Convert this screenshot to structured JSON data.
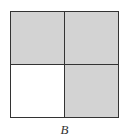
{
  "figure": {
    "label": "B",
    "cells": [
      {
        "position": "top-left",
        "shaded": true,
        "color": "#d3d3d3"
      },
      {
        "position": "top-right",
        "shaded": true,
        "color": "#d3d3d3"
      },
      {
        "position": "bottom-left",
        "shaded": false,
        "color": "#ffffff"
      },
      {
        "position": "bottom-right",
        "shaded": true,
        "color": "#d3d3d3"
      }
    ]
  }
}
